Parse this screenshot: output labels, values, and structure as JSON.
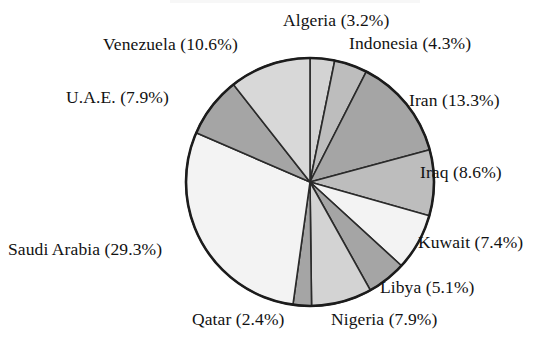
{
  "chart_data": {
    "type": "pie",
    "title": "",
    "subtitle": "",
    "xlabel": "",
    "ylabel": "",
    "legend_position": "none",
    "label_format": "name (value%)",
    "start_angle_deg": 90,
    "direction": "clockwise",
    "categories": [
      "Algeria",
      "Indonesia",
      "Iran",
      "Iraq",
      "Kuwait",
      "Libya",
      "Nigeria",
      "Qatar",
      "Saudi Arabia",
      "U.A.E.",
      "Venezuela"
    ],
    "values": [
      3.2,
      4.3,
      13.3,
      8.6,
      7.4,
      5.1,
      7.9,
      2.4,
      29.3,
      7.9,
      10.6
    ],
    "units": "percent",
    "total": 100.0,
    "slices": [
      {
        "name": "Algeria",
        "value": 3.2,
        "label": "Algeria  (3.2%)",
        "color": "#d3d3d3"
      },
      {
        "name": "Indonesia",
        "value": 4.3,
        "label": "Indonesia  (4.3%)",
        "color": "#bdbdbd"
      },
      {
        "name": "Iran",
        "value": 13.3,
        "label": "Iran  (13.3%)",
        "color": "#a5a5a5"
      },
      {
        "name": "Iraq",
        "value": 8.6,
        "label": "Iraq  (8.6%)",
        "color": "#bdbdbd"
      },
      {
        "name": "Kuwait",
        "value": 7.4,
        "label": "Kuwait  (7.4%)",
        "color": "#f3f3f3"
      },
      {
        "name": "Libya",
        "value": 5.1,
        "label": "Libya  (5.1%)",
        "color": "#a5a5a5"
      },
      {
        "name": "Nigeria",
        "value": 7.9,
        "label": "Nigeria  (7.9%)",
        "color": "#d3d3d3"
      },
      {
        "name": "Qatar",
        "value": 2.4,
        "label": "Qatar  (2.4%)",
        "color": "#a5a5a5"
      },
      {
        "name": "Saudi Arabia",
        "value": 29.3,
        "label": "Saudi Arabia  (29.3%)",
        "color": "#f3f3f3"
      },
      {
        "name": "U.A.E.",
        "value": 7.9,
        "label": "U.A.E.  (7.9%)",
        "color": "#a5a5a5"
      },
      {
        "name": "Venezuela",
        "value": 10.6,
        "label": "Venezuela  (10.6%)",
        "color": "#d8d8d8"
      }
    ],
    "geometry": {
      "center_x": 310,
      "center_y": 182,
      "radius": 124
    },
    "colors": {
      "outline": "#1c1c1c",
      "slice_border": "#2a2a2a",
      "background": "#ffffff",
      "text": "#121212"
    }
  }
}
